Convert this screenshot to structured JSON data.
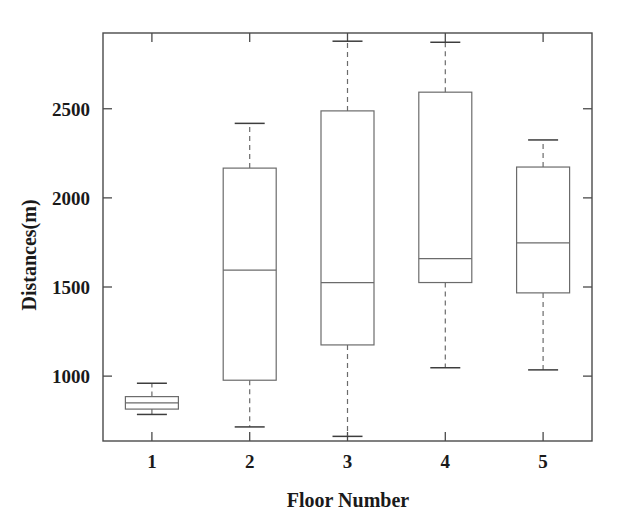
{
  "chart_data": {
    "type": "box",
    "title": "",
    "xlabel": "Floor Number",
    "ylabel": "Distances(m)",
    "categories": [
      "1",
      "2",
      "3",
      "4",
      "5"
    ],
    "xtick_labels": [
      "1",
      "2",
      "3",
      "4",
      "5"
    ],
    "ytick_labels": [
      "1000",
      "1500",
      "2000",
      "2500"
    ],
    "ytick_values": [
      1000,
      1500,
      2000,
      2500
    ],
    "ylim": [
      636,
      2925
    ],
    "xlim": [
      0.5,
      5.5
    ],
    "grid": false,
    "legend": false,
    "boxes": [
      {
        "category": "1",
        "whisker_low": 785,
        "q1": 815,
        "median": 850,
        "q3": 885,
        "whisker_high": 960
      },
      {
        "category": "2",
        "whisker_low": 715,
        "q1": 977,
        "median": 1595,
        "q3": 2167,
        "whisker_high": 2418
      },
      {
        "category": "3",
        "whisker_low": 662,
        "q1": 1175,
        "median": 1525,
        "q3": 2488,
        "whisker_high": 2879
      },
      {
        "category": "4",
        "whisker_low": 1047,
        "q1": 1525,
        "median": 1659,
        "q3": 2593,
        "whisker_high": 2873
      },
      {
        "category": "5",
        "whisker_low": 1035,
        "q1": 1467,
        "median": 1747,
        "q3": 2173,
        "whisker_high": 2325
      }
    ]
  },
  "axes": {
    "y_title": "Distances(m)",
    "x_title": "Floor Number"
  },
  "colors": {
    "box_stroke": "#6b6b6b",
    "frame_stroke": "#4a4a4a",
    "cap_stroke": "#3d3d3d",
    "text": "#1a1a1a",
    "background": "#ffffff"
  }
}
